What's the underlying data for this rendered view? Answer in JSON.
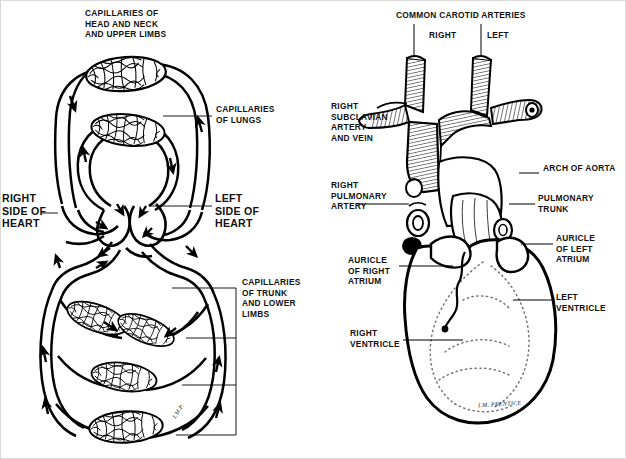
{
  "figure": {
    "ink_color": "#000000",
    "background": "#ffffff",
    "panels": [
      {
        "id": "left",
        "name": "circulation-schematic"
      },
      {
        "id": "right",
        "name": "heart-anterior-view"
      }
    ]
  },
  "left_panel": {
    "name": "blood-circulation-schematic",
    "labels": {
      "capillaries_head": "CAPILLARIES OF\nHEAD AND NECK\nAND UPPER LIMBS",
      "capillaries_lungs": "CAPILLARIES\nOF LUNGS",
      "right_side": "RIGHT\nSIDE OF\nHEART",
      "left_side": "LEFT\nSIDE OF\nHEART",
      "capillaries_trunk": "CAPILLARIES\nOF TRUNK\nAND LOWER\nLIMBS"
    },
    "artist_initials": "I.M.P.",
    "capillary_beds": [
      {
        "name": "head-neck-upper-limbs",
        "cx": 125,
        "cy": 78
      },
      {
        "name": "lungs",
        "cx": 127,
        "cy": 128
      },
      {
        "name": "trunk-upper",
        "cx": 97,
        "cy": 318
      },
      {
        "name": "trunk-middle",
        "cx": 140,
        "cy": 312
      },
      {
        "name": "lower-limbs-middle",
        "cx": 122,
        "cy": 375
      },
      {
        "name": "lower-limbs-lower",
        "cx": 125,
        "cy": 425
      }
    ]
  },
  "right_panel": {
    "name": "heart-anterior-anatomy",
    "labels": {
      "common_carotid": "COMMON CAROTID ARTERIES",
      "carotid_right": "RIGHT",
      "carotid_left": "LEFT",
      "right_subclavian": "RIGHT\nSUBCLAVIAN\nARTERY\nAND VEIN",
      "right_pulmonary_artery": "RIGHT\nPULMONARY\nARTERY",
      "arch_of_aorta": "ARCH OF AORTA",
      "pulmonary_trunk": "PULMONARY\nTRUNK",
      "auricle_right_atrium": "AURICLE\nOF RIGHT\nATRIUM",
      "auricle_left_atrium": "AURICLE\nOF LEFT\nATRIUM",
      "right_ventricle": "RIGHT\nVENTRICLE",
      "left_ventricle": "LEFT\nVENTRICLE"
    },
    "signature": "I.M. PRENTICE"
  }
}
